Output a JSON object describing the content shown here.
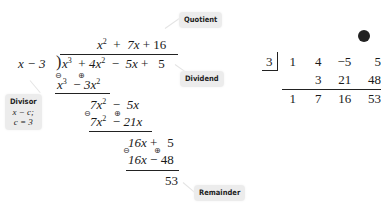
{
  "long_division": {
    "quotient": {
      "t1": "x",
      "e1": "2",
      "op1": "+",
      "t2": "7x",
      "op2": "+",
      "t3": "16"
    },
    "divisor": {
      "text": "x − 3"
    },
    "dividend": {
      "t1": "x",
      "e1": "3",
      "op1": "+",
      "t2": "4x",
      "e2": "2",
      "op2": "−",
      "t3": "5x",
      "op3": "+",
      "t4": "5"
    },
    "steps": [
      {
        "t1": "x",
        "e1": "3",
        "op": "−",
        "t2": "3x",
        "e2": "2",
        "s1": "⊖",
        "s2": "⊕"
      },
      {
        "t1": "7x",
        "e1": "2",
        "op": "−",
        "t2": "5x"
      },
      {
        "t1": "7x",
        "e1": "2",
        "op": "−",
        "t2": "21x",
        "s1": "⊖",
        "s2": "⊕"
      },
      {
        "t1": "16x",
        "op": "+",
        "t2": "5"
      },
      {
        "t1": "16x",
        "op": "−",
        "t2": "48",
        "s1": "⊖",
        "s2": "⊕"
      }
    ],
    "remainder": "53"
  },
  "labels": {
    "quotient": "Quotient",
    "dividend": "Dividend",
    "divisor": "Divisor",
    "divisor_form": "x − c;",
    "divisor_c": "c = 3",
    "remainder": "Remainder"
  },
  "synthetic_division": {
    "c": "3",
    "coefficients": [
      "1",
      "4",
      "−5",
      "5"
    ],
    "products": [
      "",
      "3",
      "21",
      "48"
    ],
    "results": [
      "1",
      "7",
      "16",
      "53"
    ]
  }
}
